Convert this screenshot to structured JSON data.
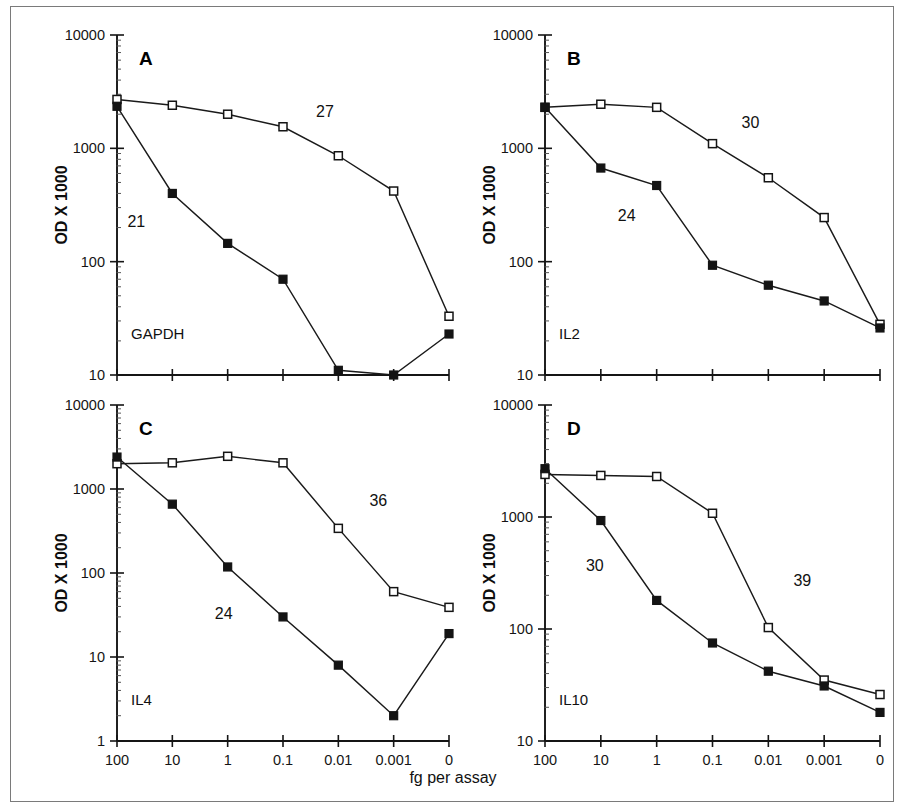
{
  "figure": {
    "xaxis_title": "fg per assay",
    "ylabel": "OD X 1000",
    "x_categories": [
      "100",
      "10",
      "1",
      "0.1",
      "0.01",
      "0.001",
      "0"
    ]
  },
  "chart_data": [
    {
      "type": "line",
      "panel": "A",
      "title": "A",
      "gene": "GAPDH",
      "xlabel": "fg per assay",
      "ylabel": "OD X 1000",
      "categories": [
        "100",
        "10",
        "1",
        "0.1",
        "0.01",
        "0.001",
        "0"
      ],
      "ylim": [
        10,
        10000
      ],
      "ytick_labels": [
        "10",
        "100",
        "1000",
        "10000"
      ],
      "grid": false,
      "legend": "none",
      "series": [
        {
          "name": "27",
          "marker": "open-square",
          "annotation": "27",
          "values": [
            2700,
            2400,
            2000,
            1550,
            860,
            420,
            33
          ]
        },
        {
          "name": "21",
          "marker": "filled-square",
          "annotation": "21",
          "values": [
            2350,
            400,
            145,
            70,
            11,
            10,
            23
          ]
        }
      ]
    },
    {
      "type": "line",
      "panel": "B",
      "title": "B",
      "gene": "IL2",
      "xlabel": "fg per assay",
      "ylabel": "OD X 1000",
      "categories": [
        "100",
        "10",
        "1",
        "0.1",
        "0.01",
        "0.001",
        "0"
      ],
      "ylim": [
        10,
        10000
      ],
      "ytick_labels": [
        "10",
        "100",
        "1000",
        "10000"
      ],
      "grid": false,
      "legend": "none",
      "series": [
        {
          "name": "30",
          "marker": "open-square",
          "annotation": "30",
          "values": [
            2300,
            2450,
            2300,
            1100,
            550,
            245,
            28
          ]
        },
        {
          "name": "24",
          "marker": "filled-square",
          "annotation": "24",
          "values": [
            2300,
            670,
            470,
            93,
            62,
            45,
            26
          ]
        }
      ]
    },
    {
      "type": "line",
      "panel": "C",
      "title": "C",
      "gene": "IL4",
      "xlabel": "fg per assay",
      "ylabel": "OD X 1000",
      "categories": [
        "100",
        "10",
        "1",
        "0.1",
        "0.01",
        "0.001",
        "0"
      ],
      "ylim": [
        1,
        10000
      ],
      "ytick_labels": [
        "1",
        "10",
        "100",
        "1000",
        "10000"
      ],
      "grid": false,
      "legend": "none",
      "series": [
        {
          "name": "36",
          "marker": "open-square",
          "annotation": "36",
          "values": [
            2000,
            2050,
            2450,
            2050,
            340,
            60,
            39
          ]
        },
        {
          "name": "24",
          "marker": "filled-square",
          "annotation": "24",
          "values": [
            2400,
            660,
            118,
            30,
            8,
            2,
            19
          ]
        }
      ]
    },
    {
      "type": "line",
      "panel": "D",
      "title": "D",
      "gene": "IL10",
      "xlabel": "fg per assay",
      "ylabel": "OD X 1000",
      "categories": [
        "100",
        "10",
        "1",
        "0.1",
        "0.01",
        "0.001",
        "0"
      ],
      "ylim": [
        10,
        10000
      ],
      "ytick_labels": [
        "10",
        "100",
        "1000",
        "10000"
      ],
      "grid": false,
      "legend": "none",
      "series": [
        {
          "name": "39",
          "marker": "open-square",
          "annotation": "39",
          "values": [
            2400,
            2350,
            2300,
            1080,
            103,
            35,
            26
          ]
        },
        {
          "name": "30",
          "marker": "filled-square",
          "annotation": "30",
          "values": [
            2700,
            930,
            180,
            75,
            42,
            31,
            18
          ]
        }
      ]
    }
  ]
}
